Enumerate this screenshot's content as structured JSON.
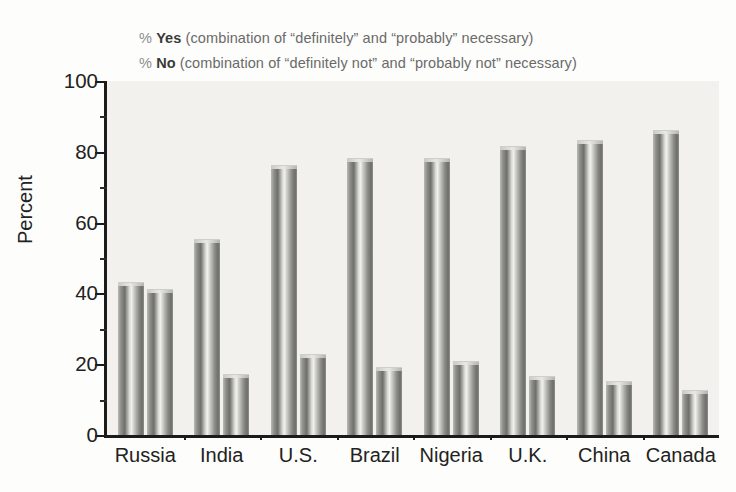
{
  "legend": {
    "rows": [
      {
        "pct": "%",
        "key": "Yes",
        "desc": "(combination of “definitely” and “probably” necessary)"
      },
      {
        "pct": "%",
        "key": "No",
        "desc": "(combination of “definitely not” and “probably not” necessary)"
      }
    ]
  },
  "chart_data": {
    "type": "bar",
    "title": "",
    "xlabel": "",
    "ylabel": "Percent",
    "ylim": [
      0,
      100
    ],
    "yticks": [
      0,
      20,
      40,
      60,
      80,
      100
    ],
    "ytick_labels": [
      "0",
      "20",
      "40",
      "60",
      "80",
      "100"
    ],
    "yminor_ticks": [
      10,
      30,
      50,
      70,
      90
    ],
    "grid": false,
    "legend_position": "above-plot",
    "categories": [
      "Russia",
      "India",
      "U.S.",
      "Brazil",
      "Nigeria",
      "U.K.",
      "China",
      "Canada"
    ],
    "series": [
      {
        "name": "% Yes",
        "values": [
          43,
          55,
          76,
          78,
          78,
          81.5,
          83,
          86
        ]
      },
      {
        "name": "% No",
        "values": [
          41,
          17,
          22.5,
          19,
          20.5,
          16.5,
          15,
          12.5
        ]
      }
    ],
    "bar_color": "#8c8c89"
  }
}
